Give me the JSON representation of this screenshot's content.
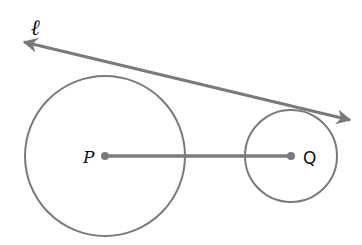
{
  "diagram": {
    "title": "",
    "colors": {
      "stroke": "#7a7a7a",
      "text": "#111111",
      "background": "#ffffff"
    },
    "line": {
      "label": "ℓ",
      "description": "common external tangent line with arrows at both ends"
    },
    "circles": [
      {
        "center_label": "P",
        "cx": 105,
        "cy": 156,
        "r": 80
      },
      {
        "center_label": "Q",
        "cx": 291,
        "cy": 156,
        "r": 46
      }
    ],
    "segment": {
      "from": "P",
      "to": "Q"
    }
  }
}
